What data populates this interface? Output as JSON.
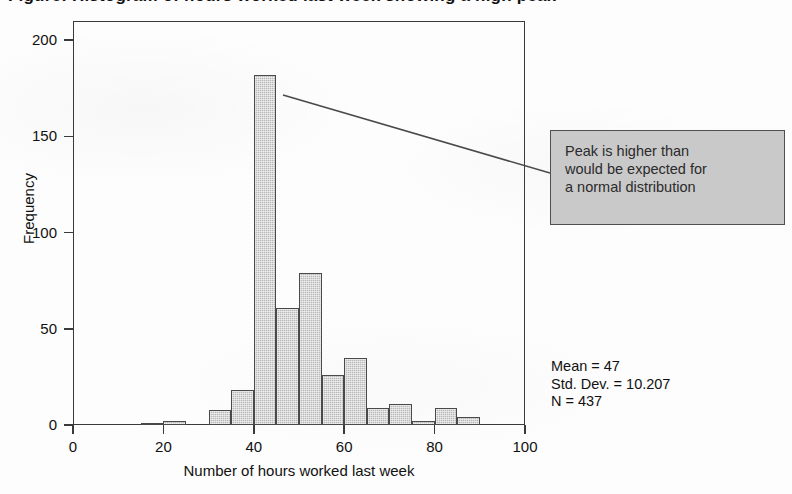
{
  "figure": {
    "title_clipped": "Figure: Histogram of hours worked last week showing a high peak",
    "background_color": "#fdfdfd"
  },
  "chart_data": {
    "type": "bar",
    "title": "",
    "subtitle": "",
    "xlabel": "Number of hours worked last week",
    "ylabel": "Frequency",
    "xlim": [
      0,
      100
    ],
    "ylim": [
      0,
      210
    ],
    "xticks": [
      "0",
      "20",
      "40",
      "60",
      "80",
      "100"
    ],
    "xtick_values": [
      0,
      20,
      40,
      60,
      80,
      100
    ],
    "yticks": [
      "0",
      "50",
      "100",
      "150",
      "200"
    ],
    "ytick_values": [
      0,
      50,
      100,
      150,
      200
    ],
    "grid": false,
    "legend": null,
    "bin_width": 5,
    "bar_fill_color": "#b8b8b8",
    "bar_edge_color": "#4a4a4a",
    "categories": [
      "0-5",
      "5-10",
      "10-15",
      "15-20",
      "20-25",
      "25-30",
      "30-35",
      "35-40",
      "40-45",
      "45-50",
      "50-55",
      "55-60",
      "60-65",
      "65-70",
      "70-75",
      "75-80",
      "80-85",
      "85-90"
    ],
    "bin_starts": [
      0,
      5,
      10,
      15,
      20,
      25,
      30,
      35,
      40,
      45,
      50,
      55,
      60,
      65,
      70,
      75,
      80,
      85
    ],
    "values": [
      0,
      0,
      0,
      1,
      2,
      0,
      8,
      18,
      182,
      61,
      79,
      26,
      35,
      9,
      11,
      2,
      9,
      4
    ],
    "annotations": [
      {
        "name": "peak-callout",
        "lines": [
          "Peak is higher than",
          "would be expected for",
          "a normal distribution"
        ],
        "target_bin": "40-45",
        "box_fill": "#c9c9c9",
        "box_border": "#4f4f4f"
      }
    ],
    "stats": {
      "mean_line": "Mean = 47",
      "stddev_line": "Std. Dev. = 10.207",
      "n_line": "N = 437",
      "mean": 47,
      "std_dev": 10.207,
      "n": 437
    }
  }
}
